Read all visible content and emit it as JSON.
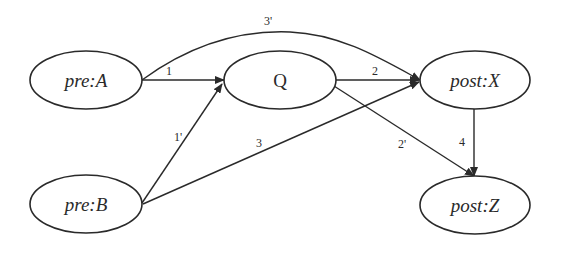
{
  "diagram": {
    "type": "directed-graph",
    "nodes": [
      {
        "id": "preA",
        "label": "pre:A",
        "italic": true
      },
      {
        "id": "Q",
        "label": "Q",
        "italic": false
      },
      {
        "id": "postX",
        "label": "post:X",
        "italic": true
      },
      {
        "id": "preB",
        "label": "pre:B",
        "italic": true
      },
      {
        "id": "postZ",
        "label": "post:Z",
        "italic": true
      }
    ],
    "edges": [
      {
        "from": "preA",
        "to": "Q",
        "label": "1"
      },
      {
        "from": "preB",
        "to": "Q",
        "label": "1'"
      },
      {
        "from": "Q",
        "to": "postX",
        "label": "2"
      },
      {
        "from": "Q",
        "to": "postZ",
        "label": "2'"
      },
      {
        "from": "preB",
        "to": "postX",
        "label": "3"
      },
      {
        "from": "preA",
        "to": "postX",
        "label": "3'"
      },
      {
        "from": "postX",
        "to": "postZ",
        "label": "4"
      }
    ],
    "colors": {
      "stroke": "#2a2a2a",
      "background": "#ffffff"
    }
  }
}
